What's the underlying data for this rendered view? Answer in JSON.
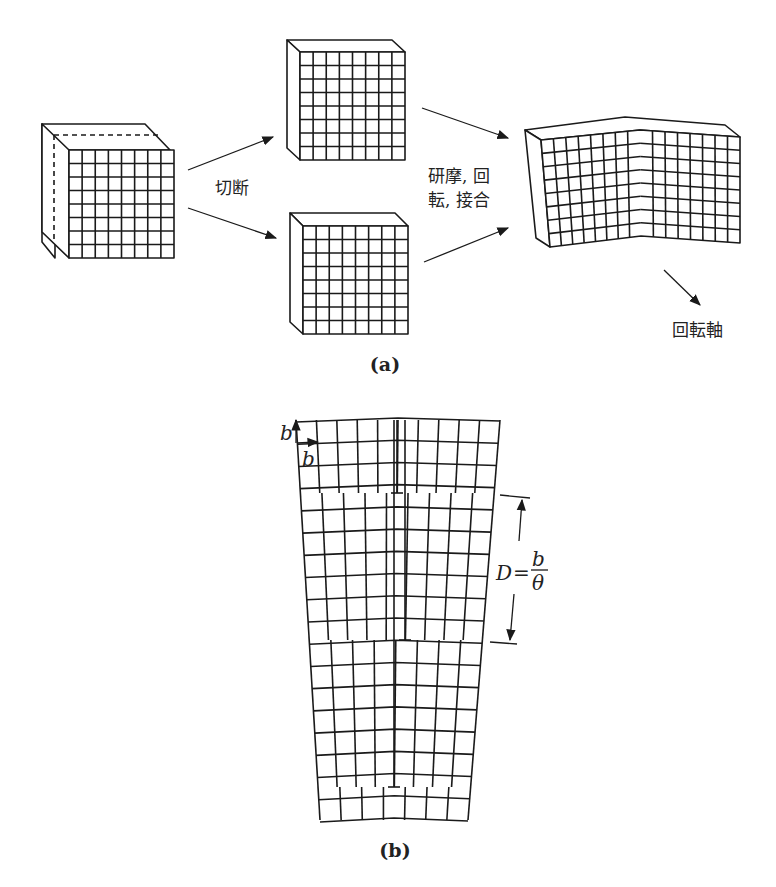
{
  "figure": {
    "panel_a": {
      "label": "(a)",
      "cut_label": "切断",
      "process_label_line1": "研摩, 回",
      "process_label_line2": "転, 接合",
      "axis_label": "回転軸",
      "grid_cells": 8
    },
    "panel_b": {
      "label": "(b)",
      "burgers_vertical": "b",
      "burgers_horizontal": "b",
      "spacing_label_D": "D",
      "spacing_label_eq": "=",
      "spacing_label_num": "b",
      "spacing_label_den": "θ",
      "dislocation_count": 3
    }
  }
}
